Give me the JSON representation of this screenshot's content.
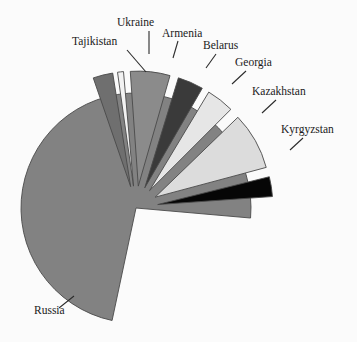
{
  "chart": {
    "type": "pie",
    "title": "",
    "background_color": "#fbfbfb",
    "outline_color": "#4a4a4a"
  },
  "chart_data": {
    "type": "pie",
    "title": "",
    "subtitle": "",
    "xlabel": "",
    "ylabel": "",
    "legend_position": "none",
    "grid": false,
    "labels": [
      "Russia",
      "Kazakhstan",
      "Kyrgyzstan",
      "Georgia",
      "Belarus",
      "Armenia",
      "Ukraine",
      "Tajikistan"
    ],
    "values": [
      73.0,
      8.0,
      2.6,
      4.0,
      3.5,
      5.5,
      0.7,
      2.7
    ],
    "slices": [
      {
        "label": "Russia",
        "value": 73.0,
        "color": "#828282",
        "exploded": false,
        "start_angle": 102,
        "end_angle": 365,
        "label_x": 34,
        "label_y": 314,
        "leader": "M 59 308 L 74 296"
      },
      {
        "label": "Tajikistan",
        "value": 2.7,
        "color": "#6f6f6f",
        "exploded": true,
        "start_angle": 251,
        "end_angle": 261,
        "label_x": 72,
        "label_y": 45,
        "leader": "M 127 50 L 146 72"
      },
      {
        "label": "Ukraine",
        "value": 0.7,
        "color": "#f2f2f2",
        "exploded": true,
        "start_angle": 262,
        "end_angle": 265,
        "label_x": 117,
        "label_y": 26,
        "leader": "M 149 31 L 149 54"
      },
      {
        "label": "Armenia",
        "value": 5.5,
        "color": "#8b8b8b",
        "exploded": true,
        "start_angle": 266,
        "end_angle": 286,
        "label_x": 162,
        "label_y": 37,
        "leader": "M 178 41 L 173 58"
      },
      {
        "label": "Belarus",
        "value": 3.5,
        "color": "#3a3a3a",
        "exploded": true,
        "start_angle": 287,
        "end_angle": 300,
        "label_x": 203,
        "label_y": 49,
        "leader": "M 216 54 L 206 68"
      },
      {
        "label": "Georgia",
        "value": 4.0,
        "color": "#e6e6e6",
        "exploded": true,
        "start_angle": 301,
        "end_angle": 315,
        "label_x": 235,
        "label_y": 66,
        "leader": "M 246 71 L 232 84"
      },
      {
        "label": "Kazakhstan",
        "value": 8.0,
        "color": "#dcdcdc",
        "exploded": true,
        "start_angle": 316,
        "end_angle": 345,
        "label_x": 252,
        "label_y": 95,
        "leader": "M 276 100 L 262 113"
      },
      {
        "label": "Kyrgyzstan",
        "value": 2.6,
        "color": "#060606",
        "exploded": true,
        "start_angle": 346,
        "end_angle": 356,
        "label_x": 281,
        "label_y": 133,
        "leader": "M 303 138 L 290 150"
      }
    ],
    "geometry": {
      "center_x": 136,
      "center_y": 208,
      "radius": 115,
      "explode_offset": 22
    }
  }
}
